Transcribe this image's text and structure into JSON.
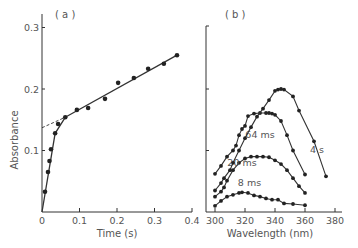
{
  "chart_data": [
    {
      "panel_label": "( a )",
      "type": "scatter",
      "title": "",
      "xlabel": "Time (s)",
      "ylabel": "Absorbance",
      "xlim": [
        0,
        0.4
      ],
      "ylim": [
        0,
        0.3
      ],
      "x_ticks": [
        0,
        0.1,
        0.2,
        0.3,
        0.4
      ],
      "x_tick_labels": [
        "0",
        "0.1",
        "0.2",
        "0.3",
        "0.4"
      ],
      "y_ticks": [
        0.1,
        0.2,
        0.3
      ],
      "y_tick_labels": [
        "0.1",
        "0.2",
        "0.3"
      ],
      "grid": false,
      "legend": null,
      "series": [
        {
          "name": "data",
          "x": [
            0.008,
            0.016,
            0.02,
            0.024,
            0.035,
            0.043,
            0.062,
            0.093,
            0.123,
            0.168,
            0.203,
            0.245,
            0.283,
            0.325,
            0.36
          ],
          "y": [
            0.033,
            0.065,
            0.083,
            0.102,
            0.128,
            0.143,
            0.154,
            0.166,
            0.169,
            0.184,
            0.21,
            0.218,
            0.233,
            0.241,
            0.255
          ]
        }
      ],
      "fit_lines": [
        {
          "name": "fast phase",
          "style": "solid",
          "x": [
            0,
            0.035,
            0.062
          ],
          "y": [
            0,
            0.128,
            0.154
          ]
        },
        {
          "name": "slow phase",
          "style": "solid",
          "x": [
            0.062,
            0.36
          ],
          "y": [
            0.154,
            0.255
          ]
        },
        {
          "name": "extrapolation",
          "style": "dashed",
          "x": [
            0,
            0.062
          ],
          "y": [
            0.137,
            0.154
          ]
        }
      ]
    },
    {
      "panel_label": "( b )",
      "type": "line",
      "title": "",
      "xlabel": "Wavelength (nm)",
      "ylabel": "",
      "xlim": [
        295,
        385
      ],
      "ylim": [
        0,
        0.3
      ],
      "x_ticks": [
        300,
        320,
        340,
        360,
        380
      ],
      "x_tick_labels": [
        "300",
        "320",
        "340",
        "360",
        "380"
      ],
      "y_ticks": [
        0.1,
        0.2
      ],
      "y_tick_labels": [
        "",
        ""
      ],
      "grid": false,
      "legend": null,
      "series": [
        {
          "name": "8 ms",
          "label_pos": [
            323,
            0.042
          ],
          "x": [
            300,
            304,
            308,
            312,
            316,
            318,
            322,
            326,
            330,
            334,
            338,
            342,
            346,
            352,
            360
          ],
          "y": [
            0.01,
            0.018,
            0.025,
            0.028,
            0.031,
            0.032,
            0.031,
            0.027,
            0.025,
            0.022,
            0.02,
            0.02,
            0.014,
            0.013,
            0.011
          ]
        },
        {
          "name": "20 ms",
          "label_pos": [
            318,
            0.074
          ],
          "x": [
            300,
            304,
            306,
            308,
            312,
            316,
            320,
            324,
            328,
            332,
            336,
            340,
            344,
            348,
            352,
            356,
            360
          ],
          "y": [
            0.025,
            0.033,
            0.04,
            0.051,
            0.068,
            0.08,
            0.087,
            0.09,
            0.09,
            0.09,
            0.089,
            0.084,
            0.078,
            0.068,
            0.055,
            0.042,
            0.031
          ]
        },
        {
          "name": "64 ms",
          "label_pos": [
            330,
            0.12
          ],
          "x": [
            300,
            304,
            308,
            312,
            314,
            316,
            318,
            320,
            322,
            326,
            330,
            334,
            336,
            338,
            340,
            344,
            348,
            352,
            360
          ],
          "y": [
            0.062,
            0.075,
            0.09,
            0.1,
            0.108,
            0.125,
            0.135,
            0.14,
            0.156,
            0.16,
            0.161,
            0.161,
            0.161,
            0.16,
            0.158,
            0.148,
            0.125,
            0.1,
            0.061
          ]
        },
        {
          "name": "4 s",
          "label_pos": [
            368,
            0.096
          ],
          "x": [
            300,
            304,
            306,
            310,
            312,
            316,
            320,
            324,
            328,
            332,
            336,
            340,
            342,
            344,
            346,
            352,
            356,
            366,
            374
          ],
          "y": [
            0.035,
            0.047,
            0.055,
            0.068,
            0.08,
            0.1,
            0.12,
            0.138,
            0.155,
            0.168,
            0.182,
            0.197,
            0.199,
            0.2,
            0.199,
            0.188,
            0.165,
            0.115,
            0.058
          ]
        }
      ]
    }
  ]
}
